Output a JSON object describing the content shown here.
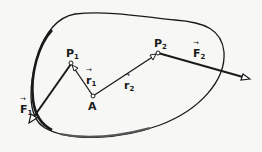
{
  "diagram": {
    "colors": {
      "ink": "#1a1a1a",
      "background": "#f7f7f5"
    },
    "body_outline": "rigid-body-blob",
    "points": [
      {
        "id": "P1",
        "label": "P",
        "sub": "1",
        "x": 71,
        "y": 64
      },
      {
        "id": "A",
        "label": "A",
        "sub": "",
        "x": 93,
        "y": 96
      },
      {
        "id": "P2",
        "label": "P",
        "sub": "2",
        "x": 158,
        "y": 53
      }
    ],
    "vectors": [
      {
        "id": "r1",
        "label": "r",
        "sub": "1",
        "from": "A",
        "to": "P1"
      },
      {
        "id": "r2",
        "label": "r",
        "sub": "2",
        "from": "A",
        "to": "P2"
      },
      {
        "id": "F1",
        "label": "F",
        "sub": "1",
        "from": "P1",
        "to": [
          30,
          122
        ]
      },
      {
        "id": "F2",
        "label": "F",
        "sub": "2",
        "from": "P2",
        "to": [
          249,
          78
        ]
      }
    ]
  },
  "labels": {
    "p1": {
      "main": "P",
      "sub": "1"
    },
    "a": {
      "main": "A"
    },
    "p2": {
      "main": "P",
      "sub": "2"
    },
    "r1": {
      "main": "r",
      "sub": "1"
    },
    "r2": {
      "main": "r",
      "sub": "2"
    },
    "f1": {
      "main": "F",
      "sub": "1"
    },
    "f2": {
      "main": "F",
      "sub": "2"
    }
  }
}
